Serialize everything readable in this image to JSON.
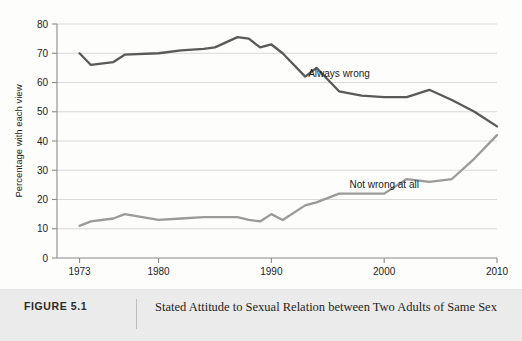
{
  "caption": {
    "figure_number": "FIGURE 5.1",
    "text": "Stated Attitude to Sexual Relation between Two Adults of Same Sex"
  },
  "chart_data": {
    "type": "line",
    "title": "",
    "subtitle": "",
    "xlabel": "",
    "ylabel": "Percentage with each view",
    "xlim": [
      1971,
      2010
    ],
    "ylim": [
      0,
      80
    ],
    "ytick_values": [
      0,
      10,
      20,
      30,
      40,
      50,
      60,
      70,
      80
    ],
    "ytick_labels": [
      "0",
      "10",
      "20",
      "30",
      "40",
      "50",
      "60",
      "70",
      "80"
    ],
    "xtick_values": [
      1973,
      1980,
      1990,
      2000,
      2010
    ],
    "xtick_labels": [
      "1973",
      "1980",
      "1990",
      "2000",
      "2010"
    ],
    "grid": "horizontal",
    "legend_position": "inline-annotation",
    "series": [
      {
        "name": "Always wrong",
        "color": "#595959",
        "annotation_label": "Always wrong",
        "annotation_x": 1996,
        "annotation_y": 62,
        "x": [
          1973,
          1974,
          1976,
          1977,
          1980,
          1982,
          1984,
          1985,
          1987,
          1988,
          1989,
          1990,
          1991,
          1993,
          1994,
          1996,
          1998,
          2000,
          2002,
          2004,
          2006,
          2008,
          2010
        ],
        "values": [
          70,
          66,
          67,
          69.5,
          70,
          71,
          71.5,
          72,
          75.5,
          75,
          72,
          73,
          70,
          62,
          65,
          57,
          55.5,
          55,
          55,
          57.5,
          54,
          50,
          45
        ]
      },
      {
        "name": "Not wrong at all",
        "color": "#9a9a9a",
        "annotation_label": "Not wrong at all",
        "annotation_x": 2000,
        "annotation_y": 24,
        "x": [
          1973,
          1974,
          1976,
          1977,
          1980,
          1982,
          1984,
          1985,
          1987,
          1988,
          1989,
          1990,
          1991,
          1993,
          1994,
          1996,
          1998,
          2000,
          2002,
          2004,
          2006,
          2008,
          2010
        ],
        "values": [
          11,
          12.5,
          13.5,
          15,
          13,
          13.5,
          14,
          14,
          14,
          13,
          12.5,
          15,
          13,
          18,
          19,
          22,
          22,
          22,
          27,
          26,
          27,
          34,
          42
        ]
      }
    ]
  },
  "colors": {
    "always_wrong": "#595959",
    "not_wrong_at_all": "#9a9a9a",
    "grid": "#cfcfcf",
    "axis": "#8a8a8a",
    "caption_background": "#ebebeb"
  }
}
